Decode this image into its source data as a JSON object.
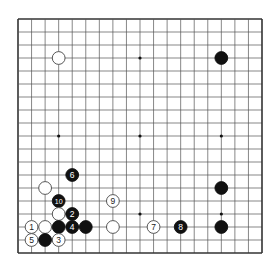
{
  "diagram": {
    "type": "go-board",
    "size": 19,
    "star_points": [
      [
        3,
        3
      ],
      [
        9,
        3
      ],
      [
        15,
        3
      ],
      [
        3,
        9
      ],
      [
        9,
        9
      ],
      [
        15,
        9
      ],
      [
        3,
        15
      ],
      [
        9,
        15
      ],
      [
        15,
        15
      ]
    ],
    "stones": [
      {
        "color": "white",
        "col": 3,
        "row": 3,
        "label": ""
      },
      {
        "color": "black",
        "col": 15,
        "row": 3,
        "label": ""
      },
      {
        "color": "black",
        "col": 4,
        "row": 12,
        "label": "6"
      },
      {
        "color": "white",
        "col": 2,
        "row": 13,
        "label": ""
      },
      {
        "color": "black",
        "col": 15,
        "row": 13,
        "label": ""
      },
      {
        "color": "black",
        "col": 3,
        "row": 14,
        "label": "10"
      },
      {
        "color": "white",
        "col": 7,
        "row": 14,
        "label": "9"
      },
      {
        "color": "white",
        "col": 3,
        "row": 15,
        "label": ""
      },
      {
        "color": "black",
        "col": 4,
        "row": 15,
        "label": "2"
      },
      {
        "color": "white",
        "col": 1,
        "row": 16,
        "label": "1"
      },
      {
        "color": "white",
        "col": 2,
        "row": 16,
        "label": ""
      },
      {
        "color": "black",
        "col": 3,
        "row": 16,
        "label": ""
      },
      {
        "color": "black",
        "col": 4,
        "row": 16,
        "label": "4"
      },
      {
        "color": "black",
        "col": 5,
        "row": 16,
        "label": ""
      },
      {
        "color": "white",
        "col": 7,
        "row": 16,
        "label": ""
      },
      {
        "color": "white",
        "col": 10,
        "row": 16,
        "label": "7"
      },
      {
        "color": "black",
        "col": 12,
        "row": 16,
        "label": "8"
      },
      {
        "color": "black",
        "col": 15,
        "row": 16,
        "label": ""
      },
      {
        "color": "white",
        "col": 1,
        "row": 17,
        "label": "5"
      },
      {
        "color": "black",
        "col": 2,
        "row": 17,
        "label": ""
      },
      {
        "color": "white",
        "col": 3,
        "row": 17,
        "label": "3"
      }
    ],
    "colors": {
      "line": "#555555",
      "black": "#111111",
      "white": "#ffffff",
      "border": "#333333"
    }
  }
}
